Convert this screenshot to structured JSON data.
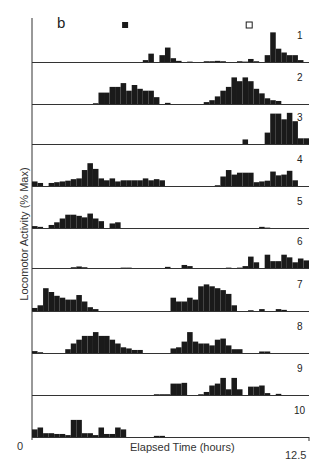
{
  "figure": {
    "panel_letter": "b",
    "ylabel": "Locomotor Activity (% Max)",
    "xlabel": "Elapsed Time (hours)",
    "x_min_label": "0",
    "x_max_label": "12.5",
    "markers": [
      {
        "type": "filled-square",
        "x_hours": 4.2
      },
      {
        "type": "open-square",
        "x_hours": 9.8
      }
    ],
    "bar_color": "#1a1a1a"
  },
  "chart_data": {
    "type": "bar",
    "title": "",
    "xlabel": "Elapsed Time (hours)",
    "ylabel": "Locomotor Activity (% Max)",
    "xlim": [
      0,
      12.5
    ],
    "ylim": [
      0,
      100
    ],
    "bin_width_hours": 0.25,
    "grid": false,
    "legend": "none",
    "series": [
      {
        "name": "1",
        "values": [
          0,
          0,
          0,
          0,
          0,
          0,
          0,
          0,
          0,
          0,
          0,
          0,
          0,
          0,
          0,
          0,
          0,
          0,
          0,
          0,
          5,
          22,
          0,
          18,
          38,
          10,
          3,
          0,
          1,
          0,
          0,
          2,
          2,
          3,
          2,
          0,
          0,
          2,
          1,
          8,
          2,
          0,
          18,
          78,
          35,
          25,
          18,
          18,
          5,
          0
        ]
      },
      {
        "name": "2",
        "values": [
          0,
          0,
          0,
          0,
          0,
          0,
          0,
          0,
          0,
          0,
          0,
          2,
          30,
          30,
          45,
          45,
          55,
          35,
          50,
          40,
          35,
          35,
          18,
          0,
          3,
          0,
          0,
          0,
          0,
          0,
          0,
          5,
          10,
          20,
          35,
          45,
          70,
          60,
          70,
          60,
          40,
          28,
          15,
          10,
          8,
          0,
          0,
          0,
          0,
          0
        ]
      },
      {
        "name": "3",
        "values": [
          0,
          0,
          0,
          0,
          0,
          0,
          0,
          0,
          0,
          0,
          0,
          0,
          0,
          0,
          0,
          0,
          0,
          0,
          0,
          0,
          0,
          0,
          0,
          0,
          0,
          0,
          0,
          0,
          0,
          0,
          0,
          0,
          0,
          0,
          0,
          0,
          0,
          0,
          12,
          0,
          0,
          0,
          30,
          80,
          80,
          65,
          82,
          60,
          15,
          15,
          8,
          20,
          18,
          25
        ]
      },
      {
        "name": "4",
        "values": [
          12,
          8,
          0,
          8,
          10,
          12,
          14,
          18,
          20,
          42,
          60,
          45,
          20,
          15,
          20,
          12,
          15,
          15,
          15,
          15,
          20,
          15,
          18,
          15,
          0,
          0,
          0,
          0,
          0,
          0,
          0,
          0,
          0,
          2,
          25,
          42,
          30,
          35,
          35,
          35,
          10,
          12,
          14,
          38,
          28,
          30,
          40,
          15,
          0,
          0
        ]
      },
      {
        "name": "5",
        "values": [
          5,
          3,
          0,
          8,
          15,
          25,
          35,
          35,
          32,
          28,
          38,
          25,
          18,
          0,
          12,
          15,
          0,
          0,
          0,
          0,
          0,
          0,
          0,
          0,
          0,
          0,
          0,
          0,
          0,
          0,
          0,
          0,
          0,
          0,
          0,
          0,
          0,
          0,
          0,
          0,
          0,
          3,
          1,
          0,
          0,
          0,
          0,
          0,
          0,
          0
        ]
      },
      {
        "name": "6",
        "values": [
          0,
          0,
          0,
          0,
          0,
          0,
          0,
          2,
          4,
          2,
          0,
          0,
          0,
          0,
          0,
          0,
          1,
          1,
          0,
          0,
          0,
          0,
          0,
          0,
          3,
          0,
          0,
          8,
          5,
          0,
          0,
          0,
          0,
          0,
          0,
          1,
          0,
          1,
          5,
          30,
          15,
          0,
          35,
          18,
          18,
          35,
          28,
          15,
          25,
          20,
          18,
          0,
          10,
          0
        ]
      },
      {
        "name": "7",
        "values": [
          8,
          15,
          60,
          50,
          40,
          35,
          30,
          30,
          42,
          25,
          10,
          5,
          0,
          0,
          0,
          0,
          0,
          0,
          0,
          0,
          0,
          0,
          0,
          0,
          0,
          35,
          25,
          25,
          35,
          30,
          65,
          70,
          65,
          60,
          55,
          45,
          15,
          0,
          0,
          2,
          0,
          5,
          0,
          0,
          5,
          3
        ]
      },
      {
        "name": "8",
        "values": [
          5,
          2,
          0,
          0,
          0,
          0,
          10,
          25,
          35,
          45,
          45,
          55,
          45,
          45,
          35,
          25,
          15,
          12,
          8,
          8,
          0,
          0,
          0,
          0,
          0,
          12,
          15,
          30,
          55,
          30,
          25,
          25,
          20,
          35,
          38,
          20,
          10,
          10,
          0,
          0,
          0,
          4,
          4,
          0,
          0,
          0,
          0,
          0,
          0,
          0
        ]
      },
      {
        "name": "9",
        "values": [
          0,
          0,
          0,
          0,
          0,
          0,
          0,
          0,
          0,
          0,
          0,
          0,
          0,
          0,
          0,
          0,
          0,
          0,
          0,
          0,
          0,
          0,
          2,
          2,
          2,
          30,
          30,
          32,
          0,
          0,
          2,
          8,
          25,
          30,
          45,
          15,
          45,
          15,
          0,
          22,
          22,
          25,
          5,
          0,
          3,
          0,
          0,
          0,
          0,
          0
        ]
      },
      {
        "name": "10",
        "values": [
          20,
          25,
          10,
          10,
          8,
          8,
          5,
          45,
          45,
          10,
          10,
          5,
          25,
          8,
          8,
          25,
          20,
          0,
          0,
          0,
          0,
          0,
          3,
          3,
          0,
          0,
          0,
          0,
          0,
          0,
          0,
          0,
          0,
          0,
          0,
          0,
          0,
          0,
          0,
          0,
          0,
          0,
          0,
          0,
          0,
          0,
          0,
          0,
          0,
          0
        ]
      }
    ]
  },
  "caption_fragment": ""
}
